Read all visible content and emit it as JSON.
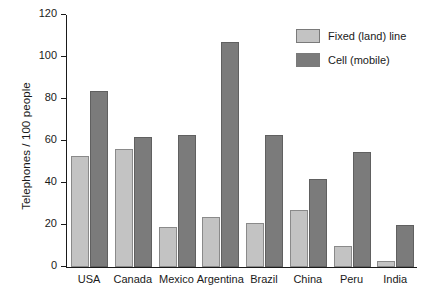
{
  "chart_data": {
    "type": "bar",
    "title": "",
    "xlabel": "",
    "ylabel": "Telephones / 100 people",
    "ylim": [
      0,
      120
    ],
    "yticks": [
      0,
      20,
      40,
      60,
      80,
      100,
      120
    ],
    "grid": false,
    "legend_position": "top-right",
    "categories": [
      "USA",
      "Canada",
      "Mexico",
      "Argentina",
      "Brazil",
      "China",
      "Peru",
      "India"
    ],
    "series": [
      {
        "name": "Fixed (land) line",
        "color": "#c3c3c3",
        "values": [
          53,
          56,
          19,
          24,
          21,
          27,
          10,
          3
        ]
      },
      {
        "name": "Cell (mobile)",
        "color": "#7b7b7b",
        "values": [
          84,
          62,
          63,
          107,
          63,
          42,
          55,
          20
        ]
      }
    ]
  },
  "axis": {
    "y_title": "Telephones / 100 people",
    "y_tick_labels": [
      "0",
      "20",
      "40",
      "60",
      "80",
      "100",
      "120"
    ]
  },
  "legend": {
    "items": [
      {
        "label": "Fixed (land) line",
        "color": "#c3c3c3"
      },
      {
        "label": "Cell (mobile)",
        "color": "#7b7b7b"
      }
    ]
  }
}
